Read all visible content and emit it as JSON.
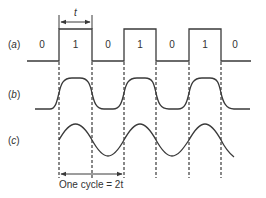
{
  "diagram": {
    "row_labels": {
      "a": "(a)",
      "b": "(b)",
      "c": "(c)"
    },
    "bits": [
      "0",
      "1",
      "0",
      "1",
      "0",
      "1",
      "0"
    ],
    "period_label": "t",
    "cycle_label": "One cycle = 2t",
    "colors": {
      "line": "#3a3a3a",
      "text": "#333333",
      "background": "#ffffff"
    }
  }
}
